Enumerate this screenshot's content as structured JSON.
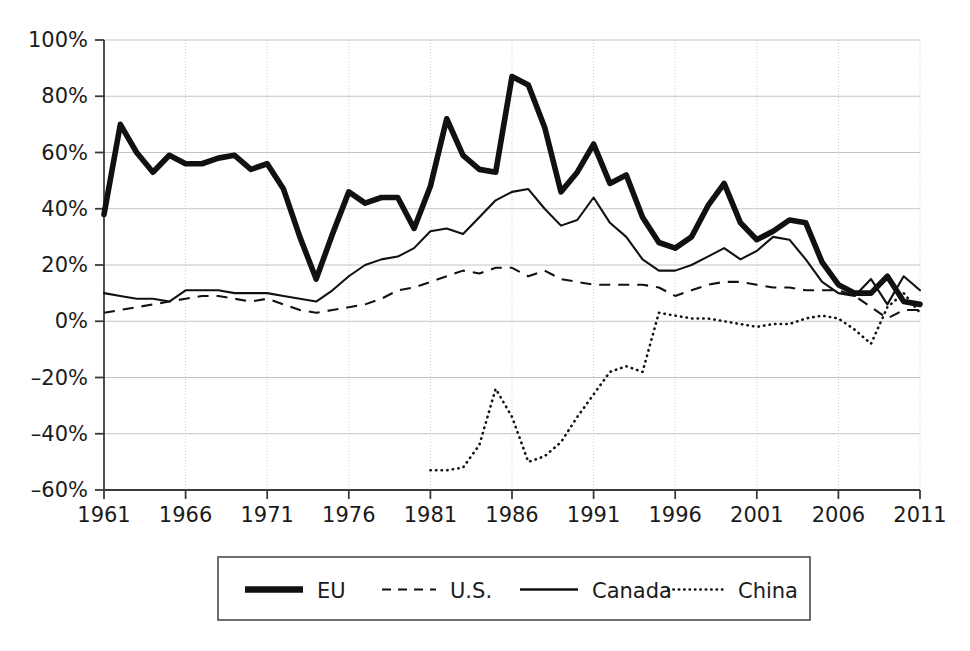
{
  "chart_data": {
    "type": "line",
    "title": "",
    "subtitle": "",
    "xlabel": "",
    "ylabel": "",
    "xlim": [
      1961,
      2011
    ],
    "ylim": [
      -60,
      100
    ],
    "grid": true,
    "legend_position": "bottom",
    "y_ticks": [
      -60,
      -40,
      -20,
      0,
      20,
      40,
      60,
      80,
      100
    ],
    "y_tick_labels": [
      "–60%",
      "–40%",
      "–20%",
      "0%",
      "20%",
      "40%",
      "60%",
      "80%",
      "100%"
    ],
    "x_ticks": [
      1961,
      1966,
      1971,
      1976,
      1981,
      1986,
      1991,
      1996,
      2001,
      2006,
      2011
    ],
    "x_tick_labels": [
      "1961",
      "1966",
      "1971",
      "1976",
      "1981",
      "1986",
      "1991",
      "1996",
      "2001",
      "2006",
      "2011"
    ],
    "series": [
      {
        "name": "EU",
        "style": "thick-solid",
        "color": "#111111",
        "x": [
          1961,
          1962,
          1963,
          1964,
          1965,
          1966,
          1967,
          1968,
          1969,
          1970,
          1971,
          1972,
          1973,
          1974,
          1975,
          1976,
          1977,
          1978,
          1979,
          1980,
          1981,
          1982,
          1983,
          1984,
          1985,
          1986,
          1987,
          1988,
          1989,
          1990,
          1991,
          1992,
          1993,
          1994,
          1995,
          1996,
          1997,
          1998,
          1999,
          2000,
          2001,
          2002,
          2003,
          2004,
          2005,
          2006,
          2007,
          2008,
          2009,
          2010,
          2011
        ],
        "values": [
          38,
          70,
          60,
          53,
          59,
          56,
          56,
          58,
          59,
          54,
          56,
          47,
          30,
          15,
          31,
          46,
          42,
          44,
          44,
          33,
          48,
          72,
          59,
          54,
          53,
          87,
          84,
          69,
          46,
          53,
          63,
          49,
          52,
          37,
          28,
          26,
          30,
          41,
          49,
          35,
          29,
          32,
          36,
          35,
          21,
          13,
          10,
          10,
          16,
          7,
          6
        ]
      },
      {
        "name": "U.S.",
        "style": "dashed",
        "color": "#111111",
        "x": [
          1961,
          1962,
          1963,
          1964,
          1965,
          1966,
          1967,
          1968,
          1969,
          1970,
          1971,
          1972,
          1973,
          1974,
          1975,
          1976,
          1977,
          1978,
          1979,
          1980,
          1981,
          1982,
          1983,
          1984,
          1985,
          1986,
          1987,
          1988,
          1989,
          1990,
          1991,
          1992,
          1993,
          1994,
          1995,
          1996,
          1997,
          1998,
          1999,
          2000,
          2001,
          2002,
          2003,
          2004,
          2005,
          2006,
          2007,
          2008,
          2009,
          2010,
          2011
        ],
        "values": [
          3,
          4,
          5,
          6,
          7,
          8,
          9,
          9,
          8,
          7,
          8,
          6,
          4,
          3,
          4,
          5,
          6,
          8,
          11,
          12,
          14,
          16,
          18,
          17,
          19,
          19,
          16,
          18,
          15,
          14,
          13,
          13,
          13,
          13,
          12,
          9,
          11,
          13,
          14,
          14,
          13,
          12,
          12,
          11,
          11,
          11,
          9,
          5,
          1,
          4,
          4
        ]
      },
      {
        "name": "Canada",
        "style": "solid",
        "color": "#111111",
        "x": [
          1961,
          1962,
          1963,
          1964,
          1965,
          1966,
          1967,
          1968,
          1969,
          1970,
          1971,
          1972,
          1973,
          1974,
          1975,
          1976,
          1977,
          1978,
          1979,
          1980,
          1981,
          1982,
          1983,
          1984,
          1985,
          1986,
          1987,
          1988,
          1989,
          1990,
          1991,
          1992,
          1993,
          1994,
          1995,
          1996,
          1997,
          1998,
          1999,
          2000,
          2001,
          2002,
          2003,
          2004,
          2005,
          2006,
          2007,
          2008,
          2009,
          2010,
          2011
        ],
        "values": [
          10,
          9,
          8,
          8,
          7,
          11,
          11,
          11,
          10,
          10,
          10,
          9,
          8,
          7,
          11,
          16,
          20,
          22,
          23,
          26,
          32,
          33,
          31,
          37,
          43,
          46,
          47,
          40,
          34,
          36,
          44,
          35,
          30,
          22,
          18,
          18,
          20,
          23,
          26,
          22,
          25,
          30,
          29,
          22,
          14,
          10,
          9,
          15,
          6,
          16,
          11
        ]
      },
      {
        "name": "China",
        "style": "dotted",
        "color": "#111111",
        "x": [
          1981,
          1982,
          1983,
          1984,
          1985,
          1986,
          1987,
          1988,
          1989,
          1990,
          1991,
          1992,
          1993,
          1994,
          1995,
          1996,
          1997,
          1998,
          1999,
          2000,
          2001,
          2002,
          2003,
          2004,
          2005,
          2006,
          2007,
          2008,
          2009,
          2010,
          2011
        ],
        "values": [
          -53,
          -53,
          -52,
          -44,
          -24,
          -34,
          -50,
          -48,
          -43,
          -34,
          -26,
          -18,
          -16,
          -18,
          3,
          2,
          1,
          1,
          0,
          -1,
          -2,
          -1,
          -1,
          1,
          2,
          1,
          -3,
          -8,
          5,
          10,
          3
        ]
      }
    ]
  },
  "legend": {
    "items": [
      {
        "label": "EU",
        "style": "thick-solid"
      },
      {
        "label": "U.S.",
        "style": "dashed"
      },
      {
        "label": "Canada",
        "style": "solid"
      },
      {
        "label": "China",
        "style": "dotted"
      }
    ]
  }
}
